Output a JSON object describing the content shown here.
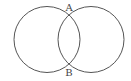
{
  "diagram": {
    "type": "two-intersecting-circles",
    "circles": [
      {
        "name": "left-circle"
      },
      {
        "name": "right-circle"
      }
    ],
    "points": [
      {
        "label": "A",
        "position": "top-intersection"
      },
      {
        "label": "B",
        "position": "bottom-intersection"
      }
    ],
    "stroke_color": "#555555"
  }
}
